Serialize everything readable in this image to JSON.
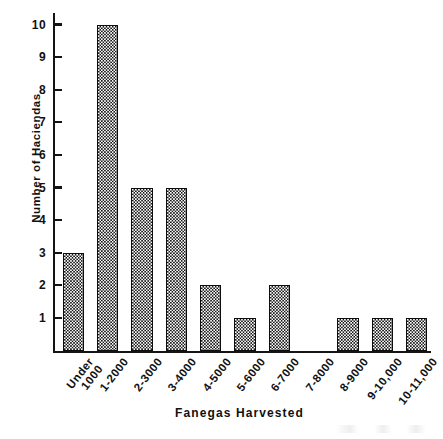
{
  "chart_data": {
    "type": "bar",
    "title": "",
    "subtitle": "",
    "xlabel": "Fanegas Harvested",
    "ylabel": "Number of Haciendas",
    "categories": [
      "Under 1000",
      "1-2000",
      "2-3000",
      "3-4000",
      "4-5000",
      "5-6000",
      "6-7000",
      "7-8000",
      "8-9000",
      "9-10,000",
      "10-11,000"
    ],
    "category_lines": [
      [
        "Under",
        "1000"
      ],
      [
        "1-2000",
        ""
      ],
      [
        "2-3000",
        ""
      ],
      [
        "3-4000",
        ""
      ],
      [
        "4-5000",
        ""
      ],
      [
        "5-6000",
        ""
      ],
      [
        "6-7000",
        ""
      ],
      [
        "7-8000",
        ""
      ],
      [
        "8-9000",
        ""
      ],
      [
        "9-10,000",
        ""
      ],
      [
        "10-11,000",
        ""
      ]
    ],
    "values": [
      3,
      10,
      5,
      5,
      2,
      1,
      2,
      0,
      1,
      1,
      1
    ],
    "ylim": [
      0,
      10
    ],
    "ytick_values": [
      1,
      2,
      3,
      4,
      5,
      6,
      7,
      8,
      9,
      10
    ],
    "ytick_labels": [
      "1",
      "2",
      "3",
      "4",
      "5",
      "6",
      "7",
      "8",
      "9",
      "10"
    ],
    "grid": false,
    "legend": null,
    "legend_position": "none",
    "bar_fill": "checkerboard-halftone",
    "colors": {
      "bar_pattern_dark": "#171717",
      "bar_pattern_light": "#ffffff",
      "bar_outline": "#0d0d0d",
      "axis": "#141414",
      "text": "#111111",
      "background": "#ffffff"
    }
  }
}
